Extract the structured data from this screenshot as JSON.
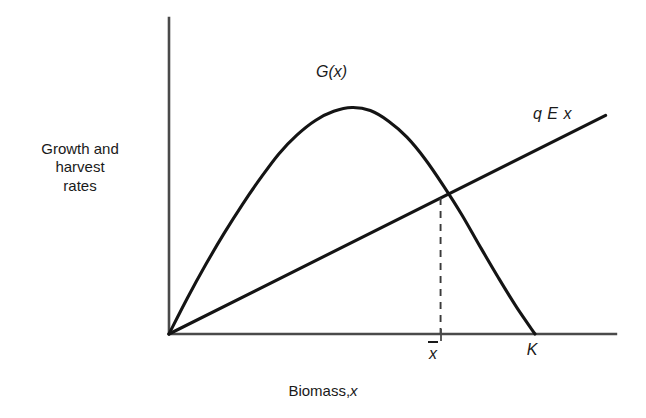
{
  "figure": {
    "background_color": "#ffffff",
    "ink_color": "#1a1a1a"
  },
  "axes": {
    "ylabel_lines": [
      "Growth and",
      "harvest",
      "rates"
    ],
    "xlabel_static": "Biomass,",
    "xlabel_variable": "x"
  },
  "annotations": {
    "curve_label": "G(x)",
    "line_label": "q E x"
  },
  "ticks": {
    "xbar": "x",
    "carrying_capacity": "K"
  },
  "chart_data": {
    "type": "line",
    "title": "",
    "subtitle": "",
    "xlabel": "Biomass, x",
    "ylabel": "Growth and harvest rates",
    "grid": false,
    "legend_position": "inline-annotation",
    "xlim": [
      0,
      1.22
    ],
    "ylim": [
      0,
      1.84
    ],
    "x_tick_labels": [
      "x̄",
      "K"
    ],
    "x_tick_values": [
      0.742,
      1.0
    ],
    "y_tick_labels": [],
    "axis_style": "open-left-bottom-spines-no-arrows",
    "annotations": [
      {
        "text": "G(x)",
        "x": 0.508,
        "y": 1.62,
        "italic": true
      },
      {
        "text": "q E x",
        "x": 1.105,
        "y": 1.32,
        "italic": true
      }
    ],
    "series": [
      {
        "name": "G(x)",
        "description": "Logistic growth curve, skewed with peak left of midpoint of K",
        "type": "line",
        "style": "solid",
        "x": [
          0.0,
          0.05,
          0.1,
          0.15,
          0.2,
          0.25,
          0.3,
          0.35,
          0.4,
          0.45,
          0.5,
          0.55,
          0.6,
          0.65,
          0.7,
          0.75,
          0.8,
          0.85,
          0.9,
          0.95,
          1.0
        ],
        "y": [
          0.0,
          0.235,
          0.455,
          0.66,
          0.85,
          1.025,
          1.185,
          1.31,
          1.405,
          1.465,
          1.49,
          1.47,
          1.4,
          1.295,
          1.15,
          0.975,
          0.785,
          0.575,
          0.37,
          0.175,
          0.0
        ]
      },
      {
        "name": "q E x",
        "description": "Harvest rate, straight line through origin",
        "type": "line",
        "style": "solid",
        "slope": 1.205,
        "x": [
          0.0,
          1.193
        ],
        "y": [
          0.0,
          1.438
        ]
      },
      {
        "name": "equilibrium-dashed",
        "description": "Vertical dashed drop from intersection to x-axis at x-bar",
        "type": "line",
        "style": "dashed",
        "x": [
          0.742,
          0.742
        ],
        "y": [
          0.0,
          0.894
        ]
      }
    ],
    "intersection": {
      "x": 0.742,
      "y": 0.894,
      "label": "x̄"
    }
  }
}
